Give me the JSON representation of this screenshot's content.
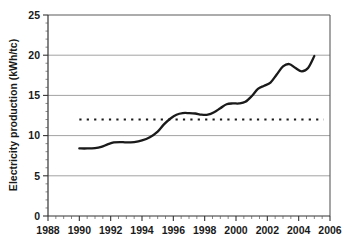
{
  "chart_data": {
    "type": "line",
    "title": "",
    "xlabel": "",
    "ylabel": "Electricity production (kWh/tc)",
    "xlim": [
      1988,
      2006
    ],
    "ylim": [
      0,
      25
    ],
    "grid": true,
    "legend": null,
    "x_tick_labels": [
      "1988",
      "1990",
      "1992",
      "1994",
      "1996",
      "1998",
      "2000",
      "2002",
      "2004",
      "2006"
    ],
    "x_ticks": [
      1988,
      1990,
      1992,
      1994,
      1996,
      1998,
      2000,
      2002,
      2004,
      2006
    ],
    "x_minor_tick_step": 0.5,
    "y_tick_labels": [
      "0",
      "5",
      "10",
      "15",
      "20",
      "25"
    ],
    "y_ticks": [
      0,
      5,
      10,
      15,
      20,
      25
    ],
    "y_minor_tick_step": 1,
    "series": [
      {
        "name": "Electricity production",
        "style": "solid",
        "x": [
          1990.0,
          1990.5,
          1991.0,
          1991.4,
          1991.8,
          1992.2,
          1992.6,
          1993.0,
          1993.5,
          1994.0,
          1994.5,
          1995.0,
          1995.4,
          1995.8,
          1996.2,
          1996.6,
          1997.0,
          1997.4,
          1997.8,
          1998.2,
          1998.6,
          1999.0,
          1999.4,
          1999.8,
          2000.2,
          2000.6,
          2001.0,
          2001.4,
          2001.8,
          2002.2,
          2002.6,
          2003.0,
          2003.4,
          2003.8,
          2004.2,
          2004.6,
          2005.0
        ],
        "y": [
          8.4,
          8.4,
          8.45,
          8.6,
          8.9,
          9.15,
          9.2,
          9.15,
          9.2,
          9.4,
          9.8,
          10.5,
          11.4,
          12.1,
          12.6,
          12.8,
          12.8,
          12.75,
          12.6,
          12.6,
          12.9,
          13.4,
          13.9,
          14.0,
          14.0,
          14.2,
          14.9,
          15.8,
          16.2,
          16.6,
          17.6,
          18.6,
          18.9,
          18.4,
          18.0,
          18.4,
          19.9
        ]
      },
      {
        "name": "Reference level",
        "style": "dotted",
        "value": 12,
        "x_start": 1990.0,
        "x_end": 2005.6
      }
    ]
  },
  "axes": {
    "y_title": "Electricity production (kWh/tc)"
  }
}
